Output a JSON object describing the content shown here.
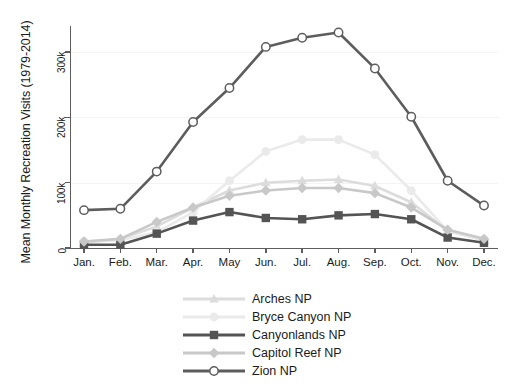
{
  "chart_data": {
    "type": "line",
    "title": "",
    "xlabel": "",
    "ylabel": "Mean Monthly Recreation Visits (1979-2014)",
    "categories": [
      "Jan.",
      "Feb.",
      "Mar.",
      "Apr.",
      "May",
      "Jun.",
      "Jul.",
      "Aug.",
      "Sep.",
      "Oct.",
      "Nov.",
      "Dec."
    ],
    "ylim": [
      0,
      340000
    ],
    "yticks": [
      0,
      100000,
      200000,
      300000
    ],
    "ytick_labels": [
      "0",
      "100k",
      "200k",
      "300k"
    ],
    "grid": true,
    "legend_position": "below-center",
    "series": [
      {
        "name": "Arches NP",
        "marker": "triangle",
        "color": "#dcdcdc",
        "values": [
          8000,
          14000,
          33000,
          62000,
          88000,
          100000,
          103000,
          105000,
          95000,
          70000,
          26000,
          12000
        ]
      },
      {
        "name": "Bryce Canyon NP",
        "marker": "circle",
        "color": "#eaeaea",
        "values": [
          10000,
          12000,
          24000,
          55000,
          103000,
          148000,
          166000,
          166000,
          143000,
          88000,
          26000,
          13000
        ]
      },
      {
        "name": "Canyonlands NP",
        "marker": "square-filled",
        "color": "#545454",
        "values": [
          5000,
          5000,
          22000,
          42000,
          55000,
          46000,
          44000,
          50000,
          52000,
          44000,
          16000,
          8000
        ]
      },
      {
        "name": "Capitol Reef NP",
        "marker": "diamond",
        "color": "#c8c8c8",
        "values": [
          10000,
          14000,
          40000,
          62000,
          80000,
          88000,
          92000,
          92000,
          84000,
          62000,
          28000,
          14000
        ]
      },
      {
        "name": "Zion NP",
        "marker": "circle-open",
        "color": "#5d5d5d",
        "values": [
          58000,
          60000,
          117000,
          193000,
          245000,
          308000,
          322000,
          330000,
          275000,
          201000,
          103000,
          65000
        ]
      }
    ]
  },
  "legend": {
    "items": [
      {
        "label": "Arches NP"
      },
      {
        "label": "Bryce Canyon NP"
      },
      {
        "label": "Canyonlands NP"
      },
      {
        "label": "Capitol Reef NP"
      },
      {
        "label": "Zion NP"
      }
    ]
  }
}
